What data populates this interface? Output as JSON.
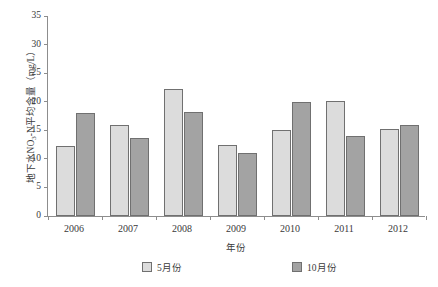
{
  "chart_data": {
    "type": "bar",
    "title": "",
    "xlabel": "年份",
    "ylabel": "地下水NO3-N平均含量（mg/L）",
    "ylabel_prefix": "地下水NO",
    "ylabel_sub": "3",
    "ylabel_suffix": "-N平均含量（mg/L）",
    "categories": [
      "2006",
      "2007",
      "2008",
      "2009",
      "2010",
      "2011",
      "2012"
    ],
    "series": [
      {
        "name": "5月份",
        "color": "#dcdcdc",
        "values": [
          12.3,
          16.0,
          22.2,
          12.5,
          15.1,
          20.1,
          15.3
        ]
      },
      {
        "name": "10月份",
        "color": "#a3a3a3",
        "values": [
          18.0,
          13.6,
          18.2,
          11.0,
          20.0,
          14.0,
          16.0
        ]
      }
    ],
    "ylim": [
      0,
      35
    ],
    "ytick_values": [
      0,
      5,
      10,
      15,
      20,
      25,
      30,
      35
    ],
    "ytick_labels": [
      "0",
      "5",
      "10",
      "15",
      "20",
      "25",
      "30",
      "35"
    ],
    "grid": false,
    "legend_position": "bottom",
    "axis_color": "#8d8d8d",
    "bar_edge_color": "#707070"
  }
}
